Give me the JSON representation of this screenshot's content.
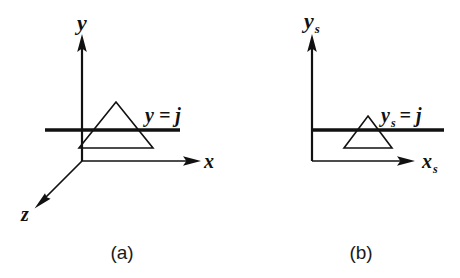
{
  "figure": {
    "type": "technical-diagram",
    "background_color": "#ffffff",
    "ink_color": "#111111",
    "panels": [
      {
        "id": "a",
        "caption": "(a)",
        "description": "Three-dimensional object space with x, y and z axes and a triangle intersected by a scan plane",
        "axes": [
          {
            "name": "y-axis",
            "label": "y",
            "direction": "up"
          },
          {
            "name": "x-axis",
            "label": "x",
            "direction": "right"
          },
          {
            "name": "z-axis",
            "label": "z",
            "direction": "down-left"
          }
        ],
        "scanline_label": "y = j",
        "shape": "triangle"
      },
      {
        "id": "b",
        "caption": "(b)",
        "description": "Two-dimensional screen space with x_s and y_s axes and the projected triangle intersected by a scan line",
        "axes": [
          {
            "name": "y-axis",
            "label": "y",
            "subscript": "s",
            "direction": "up"
          },
          {
            "name": "x-axis",
            "label": "x",
            "subscript": "s",
            "direction": "right"
          }
        ],
        "scanline_label_base": "y",
        "scanline_label_subscript": "s",
        "scanline_label_rest": " = j",
        "shape": "triangle"
      }
    ]
  },
  "labels": {
    "panel_a_y": "y",
    "panel_a_x": "x",
    "panel_a_z": "z",
    "panel_a_scanline": "y = j",
    "panel_b_y": "y",
    "panel_b_y_sub": "s",
    "panel_b_x": "x",
    "panel_b_x_sub": "s",
    "panel_b_scanline_y": "y",
    "panel_b_scanline_sub": "s",
    "panel_b_scanline_rest": "= j",
    "caption_a": "(a)",
    "caption_b": "(b)"
  }
}
